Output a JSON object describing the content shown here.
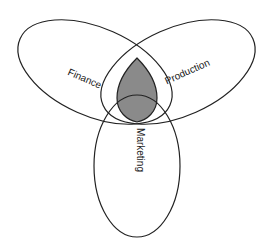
{
  "diagram": {
    "type": "venn",
    "sets": [
      {
        "name": "finance",
        "label": "Finance"
      },
      {
        "name": "production",
        "label": "Production"
      },
      {
        "name": "marketing",
        "label": "Marketing"
      }
    ],
    "intersection": {
      "sets": [
        "Finance",
        "Production",
        "Marketing"
      ],
      "fill": "#8a8a8a"
    },
    "colors": {
      "stroke": "#222222",
      "background": "#ffffff",
      "shaded": "#8a8a8a"
    }
  }
}
